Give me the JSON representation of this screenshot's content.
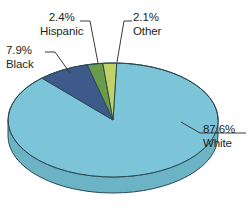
{
  "chart_data": {
    "type": "pie",
    "title": "",
    "subtitle": "",
    "xlabel": "",
    "ylabel": "",
    "legend_position": "none",
    "grid": false,
    "three_d": true,
    "units": "percent",
    "categories": [
      "White",
      "Black",
      "Hispanic",
      "Other"
    ],
    "values": [
      87.6,
      7.9,
      2.4,
      2.1
    ],
    "slices": [
      {
        "name": "White",
        "value": 87.6,
        "value_label": "87.6%",
        "color": "#7cc5d8",
        "side_color": "#6cb3c6",
        "label_position": "right"
      },
      {
        "name": "Black",
        "value": 7.9,
        "value_label": "7.9%",
        "color": "#3d5a8a",
        "side_color": "#334d77",
        "label_position": "upper-left"
      },
      {
        "name": "Hispanic",
        "value": 2.4,
        "value_label": "2.4%",
        "color": "#6b9b4a",
        "side_color": "#5c8740",
        "label_position": "top-left"
      },
      {
        "name": "Other",
        "value": 2.1,
        "value_label": "2.1%",
        "color": "#c3d169",
        "side_color": "#aebb5a",
        "label_position": "top-right"
      }
    ],
    "annotations": [
      "2.4% Hispanic",
      "2.1% Other",
      "7.9% Black",
      "87.6% White"
    ]
  },
  "labels": {
    "hispanic": {
      "pct": "2.4%",
      "name": "Hispanic"
    },
    "other": {
      "pct": "2.1%",
      "name": "Other"
    },
    "black": {
      "pct": "7.9%",
      "name": "Black"
    },
    "white": {
      "pct": "87.6%",
      "name": "White"
    }
  },
  "colors": {
    "white_slice": "#7cc5d8",
    "black_slice": "#3d5a8a",
    "hispanic_slice": "#6b9b4a",
    "other_slice": "#c3d169",
    "outline": "#2b4a52",
    "leader_line": "#3a3a3a",
    "text": "#231f20",
    "background": "#ffffff"
  }
}
